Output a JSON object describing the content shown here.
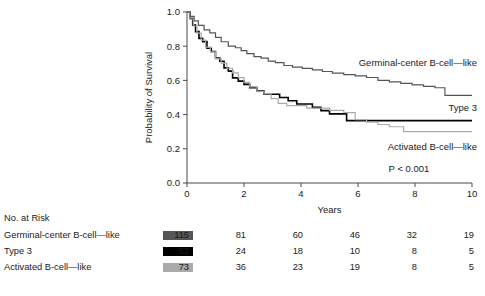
{
  "figure": {
    "y_axis_title": "Probability of Survival",
    "x_axis_title": "Years",
    "p_value": "P < 0.001",
    "y_ticks": [
      "0.0",
      "0.2",
      "0.4",
      "0.6",
      "0.8",
      "1.0"
    ],
    "x_ticks": [
      "0",
      "2",
      "4",
      "6",
      "8",
      "10"
    ],
    "curve_labels": {
      "gcb": "Germinal-center B-cell—like",
      "type3": "Type 3",
      "abc": "Activated B-cell—like"
    }
  },
  "risk_table": {
    "header": "No. at Risk",
    "rows": [
      {
        "label": "Germinal-center B-cell—like",
        "color": "#555555",
        "counts": [
          "115",
          "81",
          "60",
          "46",
          "32",
          "19"
        ]
      },
      {
        "label": "Type 3",
        "color": "#000000",
        "counts": [
          "52",
          "24",
          "18",
          "10",
          "8",
          "5"
        ]
      },
      {
        "label": "Activated B-cell—like",
        "color": "#aaaaaa",
        "counts": [
          "73",
          "36",
          "23",
          "19",
          "8",
          "5"
        ]
      }
    ]
  },
  "chart_data": {
    "type": "line",
    "title": "",
    "xlabel": "Years",
    "ylabel": "Probability of Survival",
    "xlim": [
      0,
      10
    ],
    "ylim": [
      0.0,
      1.0
    ],
    "xticks": [
      0,
      2,
      4,
      6,
      8,
      10
    ],
    "yticks": [
      0.0,
      0.2,
      0.4,
      0.6,
      0.8,
      1.0
    ],
    "grid": false,
    "legend": "inline-annotations",
    "annotations": [
      "P < 0.001"
    ],
    "series": [
      {
        "name": "Germinal-center B-cell—like",
        "color": "#555555",
        "stroke_width": 1.2,
        "points": [
          [
            0.0,
            1.0
          ],
          [
            0.12,
            0.974
          ],
          [
            0.25,
            0.948
          ],
          [
            0.4,
            0.922
          ],
          [
            0.6,
            0.896
          ],
          [
            0.8,
            0.878
          ],
          [
            1.0,
            0.852
          ],
          [
            1.2,
            0.826
          ],
          [
            1.45,
            0.8
          ],
          [
            1.7,
            0.791
          ],
          [
            1.9,
            0.774
          ],
          [
            2.1,
            0.756
          ],
          [
            2.35,
            0.739
          ],
          [
            2.6,
            0.73
          ],
          [
            2.85,
            0.713
          ],
          [
            3.1,
            0.704
          ],
          [
            3.4,
            0.687
          ],
          [
            3.7,
            0.678
          ],
          [
            4.05,
            0.67
          ],
          [
            4.4,
            0.661
          ],
          [
            4.75,
            0.652
          ],
          [
            5.1,
            0.643
          ],
          [
            5.5,
            0.634
          ],
          [
            5.9,
            0.626
          ],
          [
            6.3,
            0.617
          ],
          [
            6.7,
            0.6
          ],
          [
            7.1,
            0.591
          ],
          [
            7.5,
            0.583
          ],
          [
            7.9,
            0.574
          ],
          [
            8.3,
            0.565
          ],
          [
            8.7,
            0.557
          ],
          [
            9.05,
            0.513
          ],
          [
            10.0,
            0.513
          ]
        ]
      },
      {
        "name": "Type 3",
        "color": "#000000",
        "stroke_width": 1.6,
        "points": [
          [
            0.0,
            1.0
          ],
          [
            0.1,
            0.962
          ],
          [
            0.2,
            0.923
          ],
          [
            0.3,
            0.885
          ],
          [
            0.42,
            0.846
          ],
          [
            0.55,
            0.827
          ],
          [
            0.7,
            0.788
          ],
          [
            0.85,
            0.769
          ],
          [
            1.0,
            0.731
          ],
          [
            1.15,
            0.712
          ],
          [
            1.3,
            0.673
          ],
          [
            1.45,
            0.654
          ],
          [
            1.6,
            0.615
          ],
          [
            1.8,
            0.596
          ],
          [
            2.0,
            0.577
          ],
          [
            2.2,
            0.558
          ],
          [
            2.45,
            0.538
          ],
          [
            2.7,
            0.519
          ],
          [
            3.0,
            0.519
          ],
          [
            3.25,
            0.5
          ],
          [
            3.55,
            0.481
          ],
          [
            3.85,
            0.462
          ],
          [
            4.1,
            0.462
          ],
          [
            4.4,
            0.442
          ],
          [
            4.7,
            0.423
          ],
          [
            5.0,
            0.404
          ],
          [
            5.3,
            0.404
          ],
          [
            5.6,
            0.365
          ],
          [
            6.0,
            0.365
          ],
          [
            10.0,
            0.365
          ]
        ]
      },
      {
        "name": "Activated B-cell—like",
        "color": "#aaaaaa",
        "stroke_width": 1.2,
        "points": [
          [
            0.0,
            1.0
          ],
          [
            0.1,
            0.959
          ],
          [
            0.22,
            0.918
          ],
          [
            0.35,
            0.877
          ],
          [
            0.5,
            0.836
          ],
          [
            0.65,
            0.795
          ],
          [
            0.82,
            0.767
          ],
          [
            1.0,
            0.726
          ],
          [
            1.2,
            0.699
          ],
          [
            1.4,
            0.671
          ],
          [
            1.6,
            0.644
          ],
          [
            1.8,
            0.616
          ],
          [
            2.0,
            0.589
          ],
          [
            2.2,
            0.562
          ],
          [
            2.45,
            0.534
          ],
          [
            2.7,
            0.521
          ],
          [
            2.95,
            0.493
          ],
          [
            3.2,
            0.466
          ],
          [
            3.5,
            0.452
          ],
          [
            3.85,
            0.452
          ],
          [
            4.2,
            0.438
          ],
          [
            4.6,
            0.438
          ],
          [
            5.0,
            0.425
          ],
          [
            5.5,
            0.411
          ],
          [
            5.9,
            0.37
          ],
          [
            6.3,
            0.356
          ],
          [
            6.7,
            0.342
          ],
          [
            7.1,
            0.329
          ],
          [
            7.6,
            0.301
          ],
          [
            8.1,
            0.301
          ],
          [
            10.0,
            0.301
          ]
        ]
      }
    ]
  }
}
